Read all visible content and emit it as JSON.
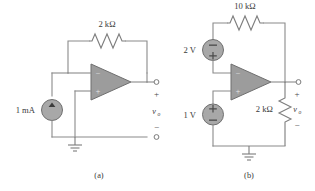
{
  "figure": {
    "background_color": "#ffffff",
    "wire_color": "#8a8a8a",
    "component_fill": "#9c9c9c",
    "label_color": "#3a3a3a"
  },
  "circuit_a": {
    "caption": "(a)",
    "feedback_resistor": {
      "label": "2 kΩ",
      "value": "2",
      "unit": "kΩ",
      "orientation": "horizontal",
      "position": "feedback-top"
    },
    "current_source": {
      "label": "1 mA",
      "value": "1",
      "unit": "mA",
      "type": "independent-current-source",
      "arrow_direction": "up"
    },
    "opamp": {
      "inverting_terminal": "−",
      "noninverting_terminal": "+",
      "inverting_position": "top",
      "noninverting_position": "bottom"
    },
    "output": {
      "label": "v",
      "subscript": "o",
      "plus": "+",
      "minus": "−",
      "terminal_type": "open-circle"
    },
    "ground": {
      "symbol": "earth-ground"
    }
  },
  "circuit_b": {
    "caption": "(b)",
    "feedback_resistor": {
      "label": "10 kΩ",
      "value": "10",
      "unit": "kΩ",
      "orientation": "horizontal",
      "position": "feedback-top"
    },
    "load_resistor": {
      "label": "2 kΩ",
      "value": "2",
      "unit": "kΩ",
      "orientation": "vertical",
      "position": "output-to-ground"
    },
    "source_top": {
      "label": "2 V",
      "value": "2",
      "unit": "V",
      "type": "independent-voltage-source",
      "top_sign": "−",
      "bottom_sign": "+"
    },
    "source_bottom": {
      "label": "1 V",
      "value": "1",
      "unit": "V",
      "type": "independent-voltage-source",
      "top_sign": "+",
      "bottom_sign": "−"
    },
    "opamp": {
      "inverting_terminal": "−",
      "noninverting_terminal": "+",
      "inverting_position": "top",
      "noninverting_position": "bottom"
    },
    "output": {
      "label": "v",
      "subscript": "o",
      "plus": "+",
      "minus": "−",
      "terminal_type": "open-circle"
    },
    "ground": {
      "symbol": "earth-ground"
    }
  }
}
